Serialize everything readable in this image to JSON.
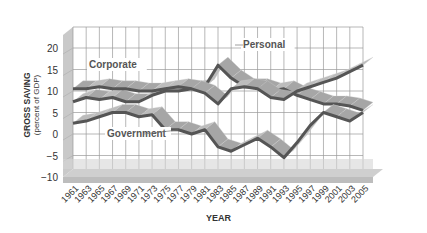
{
  "chart_data": {
    "type": "line",
    "title": "",
    "xlabel": "YEAR",
    "ylabel": "GROSS SAVING",
    "ylabel_sub": "(percent of GDP)",
    "ylim": [
      -10,
      25
    ],
    "yticks": [
      20,
      15,
      10,
      5,
      0,
      -5,
      -10
    ],
    "xticks": [
      "1961",
      "1963",
      "1965",
      "1967",
      "1969",
      "1971",
      "1973",
      "1975",
      "1977",
      "1979",
      "1981",
      "1983",
      "1985",
      "1987",
      "1989",
      "1991",
      "1993",
      "1995",
      "1997",
      "1999",
      "2001",
      "2003",
      "2005"
    ],
    "grid": true,
    "style": "3d-ribbon",
    "x": [
      1961,
      1963,
      1965,
      1967,
      1969,
      1971,
      1973,
      1975,
      1977,
      1979,
      1981,
      1983,
      1985,
      1987,
      1989,
      1991,
      1993,
      1995,
      1997,
      1999,
      2001,
      2003,
      2005
    ],
    "series": [
      {
        "name": "Personal",
        "values": [
          7.5,
          8.5,
          8,
          8.5,
          7.5,
          7.5,
          9,
          10,
          10,
          10.5,
          11,
          16,
          13,
          11,
          11,
          10,
          10.5,
          9,
          8,
          7,
          7,
          6.5,
          5.5
        ]
      },
      {
        "name": "Corporate",
        "values": [
          10.5,
          10.5,
          11,
          10.5,
          10.5,
          10,
          10,
          10.5,
          11,
          10.5,
          9.5,
          7,
          10.5,
          11,
          10.5,
          8.5,
          8,
          10,
          11,
          12,
          13,
          14.5,
          16
        ]
      },
      {
        "name": "Government",
        "values": [
          2.5,
          3,
          4,
          5,
          5,
          4,
          4.5,
          1,
          1,
          0,
          1,
          -3,
          -4,
          -2.5,
          -1,
          -3,
          -5.5,
          -2,
          2,
          5,
          4,
          3,
          5
        ]
      }
    ],
    "annotations": [
      "Corporate",
      "Personal",
      "Government"
    ]
  },
  "labels": {
    "ylabel": "GROSS SAVING",
    "ylabel_sub": "(percent of GDP)",
    "xlabel": "YEAR",
    "corporate": "Corporate",
    "personal": "Personal",
    "government": "Government"
  }
}
